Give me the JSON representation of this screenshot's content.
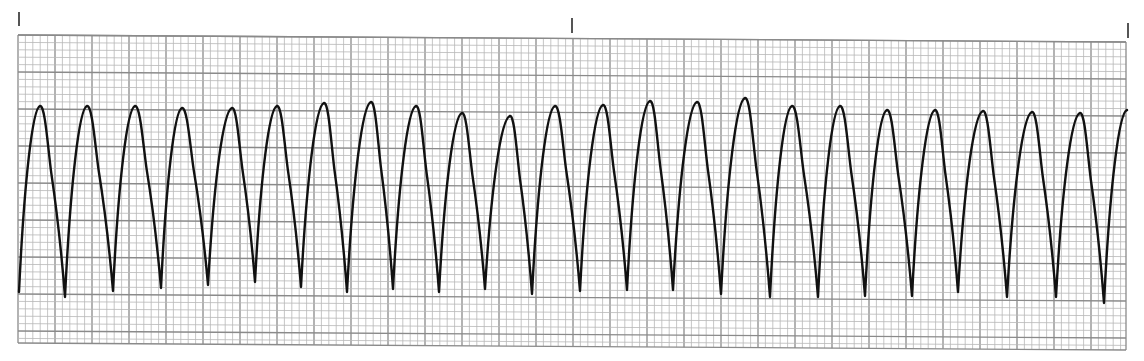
{
  "strip": {
    "kind": "ECG rhythm strip",
    "paper_color": "#ffffff",
    "grid_minor_color": "#b8b8b8",
    "grid_major_color": "#8a8a8a",
    "trace_color": "#111111",
    "grid": {
      "left": 18,
      "right": 1126,
      "top_left_y": 35,
      "top_right_y": 42,
      "bottom_left_y": 343,
      "bottom_right_y": 350,
      "minor_px": 7.4,
      "major_every": 5
    },
    "time_markers": [
      {
        "x": 19,
        "y1": 12,
        "y2": 26
      },
      {
        "x": 572,
        "y1": 18,
        "y2": 33
      },
      {
        "x": 1128,
        "y1": 23,
        "y2": 38
      }
    ],
    "complex_count": 24,
    "peaks": [
      [
        40,
        106
      ],
      [
        87,
        106
      ],
      [
        135,
        106
      ],
      [
        182,
        108
      ],
      [
        232,
        108
      ],
      [
        277,
        106
      ],
      [
        324,
        103
      ],
      [
        371,
        102
      ],
      [
        416,
        106
      ],
      [
        462,
        113
      ],
      [
        510,
        116
      ],
      [
        555,
        106
      ],
      [
        603,
        105
      ],
      [
        650,
        101
      ],
      [
        697,
        102
      ],
      [
        745,
        98
      ],
      [
        792,
        106
      ],
      [
        840,
        106
      ],
      [
        887,
        110
      ],
      [
        935,
        110
      ],
      [
        983,
        111
      ],
      [
        1032,
        112
      ],
      [
        1080,
        113
      ]
    ],
    "troughs": [
      [
        65,
        297
      ],
      [
        113,
        291
      ],
      [
        161,
        288
      ],
      [
        208,
        285
      ],
      [
        255,
        282
      ],
      [
        301,
        287
      ],
      [
        347,
        292
      ],
      [
        393,
        289
      ],
      [
        439,
        292
      ],
      [
        485,
        289
      ],
      [
        532,
        294
      ],
      [
        580,
        291
      ],
      [
        627,
        290
      ],
      [
        673,
        290
      ],
      [
        721,
        294
      ],
      [
        770,
        297
      ],
      [
        818,
        297
      ],
      [
        865,
        296
      ],
      [
        912,
        296
      ],
      [
        958,
        292
      ],
      [
        1007,
        297
      ],
      [
        1056,
        297
      ],
      [
        1104,
        303
      ]
    ],
    "start_point": [
      19,
      292
    ],
    "end_point": [
      1127,
      110
    ]
  }
}
